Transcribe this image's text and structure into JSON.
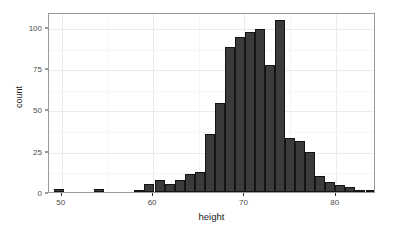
{
  "chart_data": {
    "type": "bar",
    "subtype": "histogram",
    "title": "",
    "xlabel": "height",
    "ylabel": "count",
    "xlim": [
      48.6,
      84.4
    ],
    "ylim": [
      0,
      109
    ],
    "grid": true,
    "legend": false,
    "bin_width": 1.1,
    "x_ticks": [
      50,
      60,
      70,
      80
    ],
    "x_tick_labels": [
      "50",
      "60",
      "70",
      "80"
    ],
    "y_ticks": [
      0,
      25,
      50,
      75,
      100
    ],
    "y_tick_labels": [
      "0",
      "25",
      "50",
      "75",
      "100"
    ],
    "x_minor_ticks": [
      55,
      65,
      75
    ],
    "y_minor_ticks": [
      12.5,
      37.5,
      62.5,
      87.5
    ],
    "bar_color": "#3b3b3b",
    "bar_edge_color": "#141414",
    "panel_border_color": "#9a9a9a",
    "grid_major_color": "#ebebeb",
    "grid_minor_color": "#f5f5f5",
    "bins": [
      {
        "x_center": 49.7,
        "x_start": 49.15,
        "x_end": 50.25,
        "count": 2
      },
      {
        "x_center": 50.8,
        "x_start": 50.25,
        "x_end": 51.35,
        "count": 0
      },
      {
        "x_center": 51.9,
        "x_start": 51.35,
        "x_end": 52.45,
        "count": 0
      },
      {
        "x_center": 53.0,
        "x_start": 52.45,
        "x_end": 53.55,
        "count": 0
      },
      {
        "x_center": 54.1,
        "x_start": 53.55,
        "x_end": 54.65,
        "count": 2
      },
      {
        "x_center": 55.2,
        "x_start": 54.65,
        "x_end": 55.75,
        "count": 0
      },
      {
        "x_center": 56.3,
        "x_start": 55.75,
        "x_end": 56.85,
        "count": 0
      },
      {
        "x_center": 57.4,
        "x_start": 56.85,
        "x_end": 57.95,
        "count": 0
      },
      {
        "x_center": 58.5,
        "x_start": 57.95,
        "x_end": 59.05,
        "count": 1
      },
      {
        "x_center": 59.6,
        "x_start": 59.05,
        "x_end": 60.15,
        "count": 5
      },
      {
        "x_center": 60.7,
        "x_start": 60.15,
        "x_end": 61.25,
        "count": 7
      },
      {
        "x_center": 61.8,
        "x_start": 61.25,
        "x_end": 62.35,
        "count": 5
      },
      {
        "x_center": 62.9,
        "x_start": 62.35,
        "x_end": 63.45,
        "count": 7
      },
      {
        "x_center": 64.0,
        "x_start": 63.45,
        "x_end": 64.55,
        "count": 11
      },
      {
        "x_center": 65.1,
        "x_start": 64.55,
        "x_end": 65.65,
        "count": 12
      },
      {
        "x_center": 66.2,
        "x_start": 65.65,
        "x_end": 66.75,
        "count": 35
      },
      {
        "x_center": 67.3,
        "x_start": 66.75,
        "x_end": 67.85,
        "count": 54
      },
      {
        "x_center": 68.4,
        "x_start": 67.85,
        "x_end": 68.95,
        "count": 88
      },
      {
        "x_center": 69.5,
        "x_start": 68.95,
        "x_end": 70.05,
        "count": 94
      },
      {
        "x_center": 70.6,
        "x_start": 70.05,
        "x_end": 71.15,
        "count": 97
      },
      {
        "x_center": 71.7,
        "x_start": 71.15,
        "x_end": 72.25,
        "count": 99
      },
      {
        "x_center": 72.8,
        "x_start": 72.25,
        "x_end": 73.35,
        "count": 77
      },
      {
        "x_center": 73.9,
        "x_start": 73.35,
        "x_end": 74.45,
        "count": 104
      },
      {
        "x_center": 75.0,
        "x_start": 74.45,
        "x_end": 75.55,
        "count": 33
      },
      {
        "x_center": 76.1,
        "x_start": 75.55,
        "x_end": 76.65,
        "count": 31
      },
      {
        "x_center": 77.2,
        "x_start": 76.65,
        "x_end": 77.75,
        "count": 24
      },
      {
        "x_center": 78.3,
        "x_start": 77.75,
        "x_end": 78.85,
        "count": 10
      },
      {
        "x_center": 79.4,
        "x_start": 78.85,
        "x_end": 79.95,
        "count": 6
      },
      {
        "x_center": 80.5,
        "x_start": 79.95,
        "x_end": 81.05,
        "count": 4
      },
      {
        "x_center": 81.6,
        "x_start": 81.05,
        "x_end": 82.15,
        "count": 3
      },
      {
        "x_center": 82.7,
        "x_start": 82.15,
        "x_end": 83.25,
        "count": 1
      },
      {
        "x_center": 83.8,
        "x_start": 83.25,
        "x_end": 84.35,
        "count": 1
      }
    ]
  }
}
